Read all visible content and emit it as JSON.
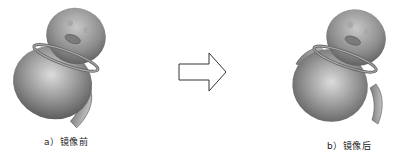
{
  "figure": {
    "before": {
      "caption": "a）镜像前",
      "shape": "penguin-model-single-wing"
    },
    "after": {
      "caption": "b）镜像后",
      "shape": "penguin-model-mirrored-wings"
    },
    "arrow": {
      "direction": "right",
      "meaning": "transform"
    },
    "colors": {
      "model": "#8c8c8c",
      "highlight": "#d6d6d6",
      "shadow": "#4a4a4a",
      "arrow_stroke": "#333333"
    }
  }
}
